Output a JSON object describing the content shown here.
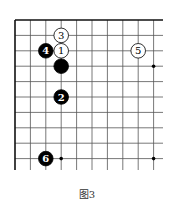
{
  "figure": {
    "caption": "图3",
    "board": {
      "origin": [
        15,
        20
      ],
      "spacing": 15.4,
      "cols": 10,
      "rows": 10,
      "line_color": "#555555",
      "edge_color": "#111111"
    },
    "stones": [
      {
        "col": 3,
        "row": 2,
        "color": "white",
        "label": "1"
      },
      {
        "col": 3,
        "row": 5,
        "color": "black",
        "label": "2"
      },
      {
        "col": 3,
        "row": 1,
        "color": "white",
        "label": "3"
      },
      {
        "col": 2,
        "row": 2,
        "color": "black",
        "label": "4"
      },
      {
        "col": 8,
        "row": 2,
        "color": "white",
        "label": "5"
      },
      {
        "col": 2,
        "row": 9,
        "color": "black",
        "label": "6"
      },
      {
        "col": 3,
        "row": 3,
        "color": "black",
        "label": ""
      }
    ],
    "hoshi": [
      [
        9,
        3
      ],
      [
        9,
        9
      ],
      [
        3,
        9
      ]
    ]
  }
}
